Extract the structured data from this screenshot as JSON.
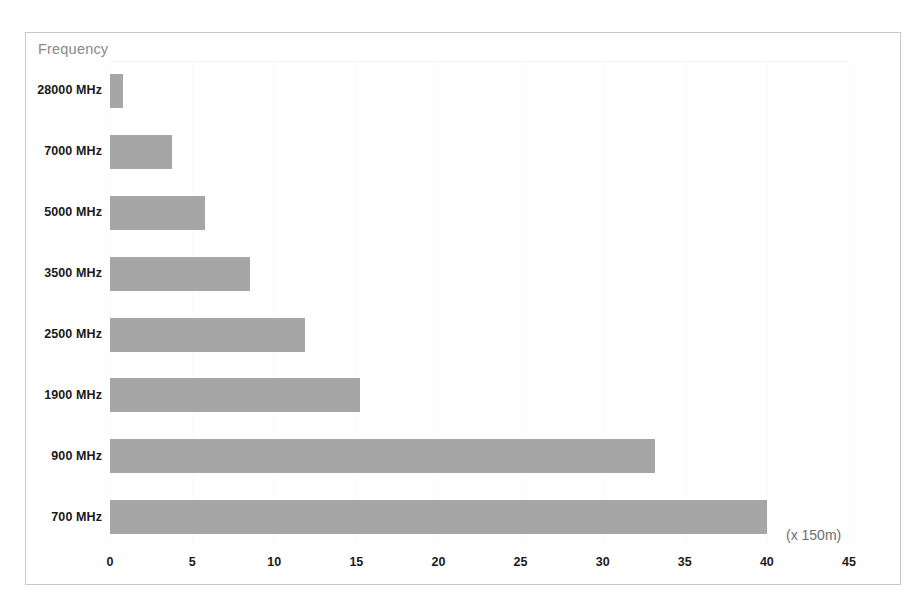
{
  "chart_data": {
    "type": "bar",
    "orientation": "horizontal",
    "title": "",
    "legend_label": "Frequency",
    "legend_position": "top-left",
    "categories": [
      "28000 MHz",
      "7000 MHz",
      "5000 MHz",
      "3500 MHz",
      "2500 MHz",
      "1900 MHz",
      "900 MHz",
      "700 MHz"
    ],
    "values": [
      0.8,
      3.8,
      5.8,
      8.5,
      11.9,
      15.2,
      33.2,
      40.0
    ],
    "xlabel": "(x 150m)",
    "ylabel": "Frequency",
    "xlim": [
      0,
      45
    ],
    "ylim": null,
    "xticks": [
      0,
      5,
      10,
      15,
      20,
      25,
      30,
      35,
      40,
      45
    ],
    "xticklabels": [
      "0",
      "5",
      "10",
      "15",
      "20",
      "25",
      "30",
      "35",
      "40",
      "45"
    ],
    "grid": true,
    "bar_color": "#a6a6a6",
    "border_color": "#c9c9c9",
    "label_color": "#1a1a1a",
    "legend_color": "#8a8a8a"
  }
}
